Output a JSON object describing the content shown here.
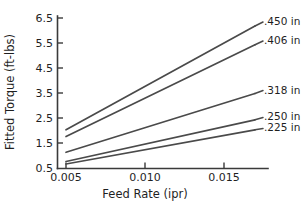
{
  "chart_data": {
    "type": "line",
    "title": "",
    "xlabel": "Feed Rate (ipr)",
    "ylabel": "Fitted Torque (ft-lbs)",
    "xlim": [
      0.0042,
      0.0178
    ],
    "ylim": [
      0.5,
      6.5
    ],
    "grid": false,
    "legend_position": "right-inline-labels",
    "xticks": [
      0.005,
      0.01,
      0.015
    ],
    "xtick_labels": [
      "0.005",
      "0.010",
      "0.015"
    ],
    "yticks": [
      0.5,
      1.5,
      2.5,
      3.5,
      4.5,
      5.5,
      6.5
    ],
    "ytick_labels": [
      "0.5",
      "1.5",
      "2.5",
      "3.5",
      "4.5",
      "5.5",
      "6.5"
    ],
    "x": [
      0.005,
      0.017
    ],
    "series": [
      {
        "name": ".450 in",
        "label": ".450 in",
        "values": [
          2.05,
          6.2
        ]
      },
      {
        "name": ".406 in",
        "label": ".406 in",
        "values": [
          1.78,
          5.45
        ]
      },
      {
        "name": ".318 in",
        "label": ".318 in",
        "values": [
          1.15,
          3.5
        ]
      },
      {
        "name": ".250 in",
        "label": ".250 in",
        "values": [
          0.78,
          2.45
        ]
      },
      {
        "name": ".225 in",
        "label": ".225 in",
        "values": [
          0.68,
          2.05
        ]
      }
    ]
  },
  "axes": {
    "ylabel": "Fitted Torque (ft-lbs)",
    "xlabel": "Feed Rate (ipr)",
    "ytick_0": "0.5",
    "ytick_1": "1.5",
    "ytick_2": "2.5",
    "ytick_3": "3.5",
    "ytick_4": "4.5",
    "ytick_5": "5.5",
    "ytick_6": "6.5",
    "xtick_0": "0.005",
    "xtick_1": "0.010",
    "xtick_2": "0.015"
  },
  "series_labels": {
    "s0": ".450 in",
    "s1": ".406 in",
    "s2": ".318 in",
    "s3": ".250 in",
    "s4": ".225 in"
  },
  "colors": {
    "line": "#4a4a4a",
    "axis": "#3a3a3a",
    "text": "#1f1f1f",
    "background": "#ffffff"
  }
}
